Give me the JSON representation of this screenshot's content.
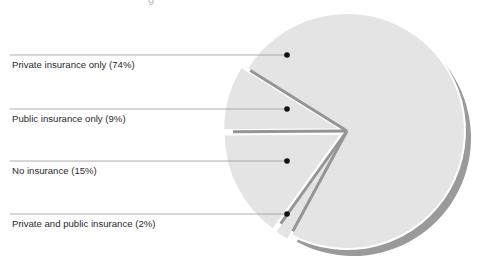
{
  "chart_data": {
    "type": "pie",
    "title": "",
    "exploded": true,
    "start_angle_deg": -148,
    "series": [
      {
        "label": "Private insurance only (74%)",
        "name": "Private insurance only",
        "value": 74
      },
      {
        "label": "Public insurance only (9%)",
        "name": "Public insurance only",
        "value": 9
      },
      {
        "label": "No insurance (15%)",
        "name": "No insurance",
        "value": 15
      },
      {
        "label": "Private and public insurance (2%)",
        "name": "Private and public insurance",
        "value": 2
      }
    ],
    "legend_position": "left, leader lines to slices"
  },
  "colors": {
    "slice_fill": "#e4e4e4",
    "slice_edge": "#959595",
    "shadow": "#9a9a9a",
    "leader_line": "#9b9b9b",
    "dot": "#111111",
    "text": "#2a2a2a"
  },
  "labels": [
    {
      "text": "Private insurance only (74%)",
      "y": 60
    },
    {
      "text": "Public insurance only (9%)",
      "y": 114
    },
    {
      "text": "No insurance (15%)",
      "y": 166
    },
    {
      "text": "Private and public insurance (2%)",
      "y": 219
    }
  ]
}
